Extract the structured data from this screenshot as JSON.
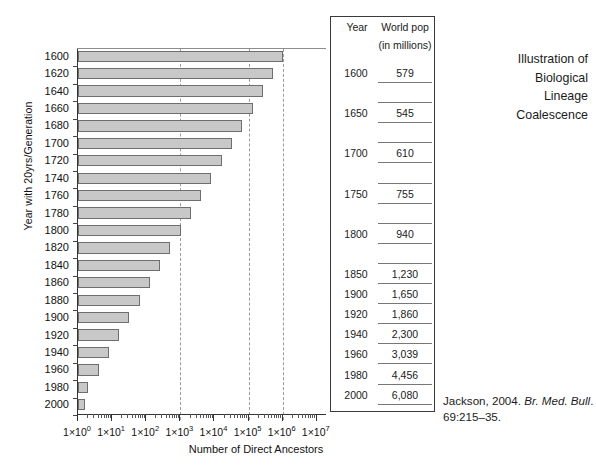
{
  "chart_data": {
    "type": "bar",
    "title": "",
    "orientation": "horizontal",
    "xlabel": "Number of Direct Ancestors",
    "ylabel": "Year with 20yrs/Generation",
    "xscale": "log",
    "xlim": [
      1,
      10000000
    ],
    "xtick_labels": [
      "1×10⁰",
      "1×10¹",
      "1×10²",
      "1×10³",
      "1×10⁴",
      "1×10⁵",
      "1×10⁶",
      "1×10⁷"
    ],
    "xtick_values": [
      1,
      10,
      100,
      1000,
      10000,
      100000,
      1000000,
      10000000
    ],
    "xtick_mantissa": "1×10",
    "xtick_exponents": [
      "0",
      "1",
      "2",
      "3",
      "4",
      "5",
      "6",
      "7"
    ],
    "gridlines": [
      1000,
      100000,
      1000000
    ],
    "grid": true,
    "legend": "none",
    "bar_color": "#c8c8c8",
    "bar_edge_color": "#6e6e6e",
    "categories": [
      1600,
      1620,
      1640,
      1660,
      1680,
      1700,
      1720,
      1740,
      1760,
      1780,
      1800,
      1820,
      1840,
      1860,
      1880,
      1900,
      1920,
      1940,
      1960,
      1980,
      2000
    ],
    "values": [
      1048576,
      524288,
      262144,
      131072,
      65536,
      32768,
      16384,
      8192,
      4096,
      2048,
      1024,
      512,
      256,
      128,
      64,
      32,
      16,
      8,
      4,
      2,
      1
    ]
  },
  "axis": {
    "y_title": "Year with 20yrs/Generation",
    "x_title": "Number of Direct Ancestors"
  },
  "table": {
    "headers": {
      "year": "Year",
      "pop": "World pop",
      "units": "(in millions)"
    },
    "rows": [
      {
        "year": "1600",
        "pop": "579"
      },
      {
        "year": "1650",
        "pop": "545"
      },
      {
        "year": "1700",
        "pop": "610"
      },
      {
        "year": "1750",
        "pop": "755"
      },
      {
        "year": "1800",
        "pop": "940"
      },
      {
        "year": "1850",
        "pop": "1,230"
      },
      {
        "year": "1900",
        "pop": "1,650"
      },
      {
        "year": "1920",
        "pop": "1,860"
      },
      {
        "year": "1940",
        "pop": "2,300"
      },
      {
        "year": "1960",
        "pop": "3,039"
      },
      {
        "year": "1980",
        "pop": "4,456"
      },
      {
        "year": "2000",
        "pop": "6,080"
      }
    ]
  },
  "caption": {
    "line1": "Illustration of",
    "line2": "Biological",
    "line3": "Lineage",
    "line4": "Coalescence"
  },
  "credit": {
    "author_year": "Jackson, 2004.",
    "journal": "Br. Med. Bull",
    "locator": ". 69:215–35."
  }
}
